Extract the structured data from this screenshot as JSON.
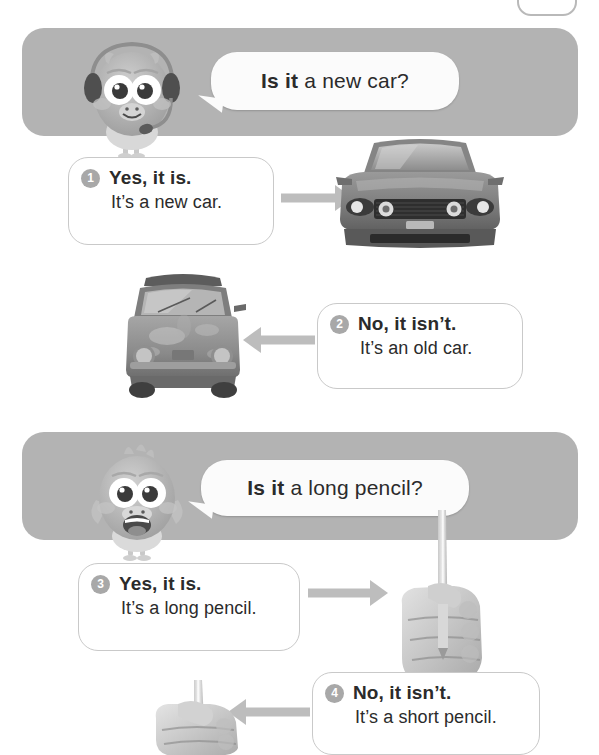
{
  "page": {
    "background_color": "#ffffff",
    "banner_color": "#b3b3b3",
    "badge_color": "#a8a8a8",
    "arrow_color": "#bdbdbd",
    "text_color": "#2b2b2b"
  },
  "sections": [
    {
      "id": "car-section",
      "mascot": "owl-with-headset-icon",
      "question": {
        "bold": "Is it",
        "rest": " a new car?",
        "full": "Is it a new car?"
      },
      "answers": [
        {
          "number": "1",
          "bold_line": "Yes, it is.",
          "plain_line": "It’s a new car.",
          "arrow": "arrow-right-icon",
          "photo": "new-car-photo",
          "photo_label": "new car"
        },
        {
          "number": "2",
          "bold_line": "No, it isn’t.",
          "plain_line": "It’s an old car.",
          "arrow": "arrow-left-icon",
          "photo": "old-car-photo",
          "photo_label": "old car"
        }
      ]
    },
    {
      "id": "pencil-section",
      "mascot": "bird-smiling-icon",
      "question": {
        "bold": "Is it",
        "rest": " a long pencil?",
        "full": "Is it a long pencil?"
      },
      "answers": [
        {
          "number": "3",
          "bold_line": "Yes, it is.",
          "plain_line": "It’s a long pencil.",
          "arrow": "arrow-right-icon",
          "photo": "long-pencil-photo",
          "photo_label": "hand holding long pencil"
        },
        {
          "number": "4",
          "bold_line": "No, it isn’t.",
          "plain_line": "It’s a short pencil.",
          "arrow": "arrow-left-icon",
          "photo": "short-pencil-photo",
          "photo_label": "hand holding short pencil"
        }
      ]
    }
  ]
}
